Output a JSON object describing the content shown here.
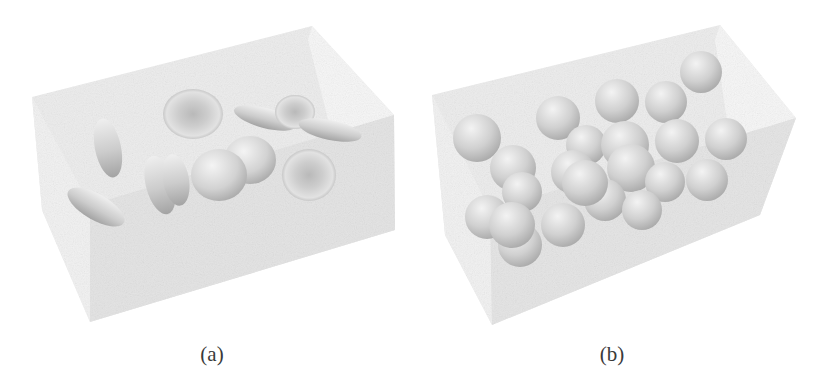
{
  "figure": {
    "panels": [
      {
        "id": "a",
        "caption": "(a)",
        "content": "translucent box containing red blood cells (biconcave discs)",
        "object_type": "biconcave-disc"
      },
      {
        "id": "b",
        "caption": "(b)",
        "content": "translucent box containing spheres",
        "object_type": "sphere"
      }
    ],
    "colors": {
      "background": "#ffffff",
      "box_fill": "#e6e6e6",
      "box_edge": "#cfcfcf",
      "object_light": "#f2f2f2",
      "object_dark": "#a9a9a9",
      "caption": "#3a3a3a"
    }
  }
}
